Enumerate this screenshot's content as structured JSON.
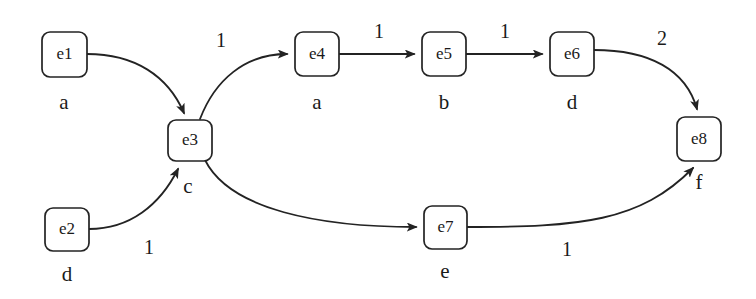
{
  "diagram": {
    "canvas": {
      "width": 756,
      "height": 299,
      "background": "#ffffff"
    },
    "stroke_color": "#232323",
    "text_color": "#1a1a1a",
    "nodes": [
      {
        "id": "e1",
        "label": "e1",
        "state": "a",
        "x": 42,
        "y": 32,
        "w": 45,
        "h": 45,
        "state_x": 64,
        "state_y": 104
      },
      {
        "id": "e2",
        "label": "e2",
        "state": "d",
        "x": 45,
        "y": 208,
        "w": 44,
        "h": 43,
        "state_x": 67,
        "state_y": 276
      },
      {
        "id": "e3",
        "label": "e3",
        "state": "c",
        "x": 168,
        "y": 120,
        "w": 44,
        "h": 41,
        "state_x": 188,
        "state_y": 188
      },
      {
        "id": "e4",
        "label": "e4",
        "state": "a",
        "x": 295,
        "y": 32,
        "w": 44,
        "h": 44,
        "state_x": 317,
        "state_y": 104
      },
      {
        "id": "e5",
        "label": "e5",
        "state": "b",
        "x": 422,
        "y": 32,
        "w": 44,
        "h": 44,
        "state_x": 444,
        "state_y": 104
      },
      {
        "id": "e6",
        "label": "e6",
        "state": "d",
        "x": 550,
        "y": 32,
        "w": 44,
        "h": 44,
        "state_x": 572,
        "state_y": 104
      },
      {
        "id": "e7",
        "label": "e7",
        "state": "e",
        "x": 424,
        "y": 206,
        "w": 43,
        "h": 43,
        "state_x": 445,
        "state_y": 273
      },
      {
        "id": "e8",
        "label": "e8",
        "state": "f",
        "x": 677,
        "y": 117,
        "w": 44,
        "h": 44,
        "state_x": 699,
        "state_y": 184
      }
    ],
    "edges": [
      {
        "id": "e1-e3",
        "from": "e1",
        "to": "e3",
        "weight": "",
        "weight_x": 0,
        "weight_y": 0,
        "path": "M 87 54 C 135 54 168 76 184 113"
      },
      {
        "id": "e2-e3",
        "from": "e2",
        "to": "e3",
        "weight": "1",
        "weight_x": 149,
        "weight_y": 249,
        "path": "M 89 229 C 130 229 160 205 178 169"
      },
      {
        "id": "e3-e4",
        "from": "e3",
        "to": "e4",
        "weight": "1",
        "weight_x": 221,
        "weight_y": 42,
        "path": "M 200 119 C 215 80 245 54 287 54"
      },
      {
        "id": "e4-e5",
        "from": "e4",
        "to": "e5",
        "weight": "1",
        "weight_x": 379,
        "weight_y": 33,
        "path": "M 339 54 L 414 54"
      },
      {
        "id": "e5-e6",
        "from": "e5",
        "to": "e6",
        "weight": "1",
        "weight_x": 505,
        "weight_y": 33,
        "path": "M 466 54 L 542 54"
      },
      {
        "id": "e6-e8",
        "from": "e6",
        "to": "e8",
        "weight": "2",
        "weight_x": 662,
        "weight_y": 40,
        "path": "M 594 50 C 650 50 686 70 697 109"
      },
      {
        "id": "e3-e7",
        "from": "e3",
        "to": "e7",
        "weight": "",
        "weight_x": 0,
        "weight_y": 0,
        "path": "M 205 160 C 230 210 320 227 416 227"
      },
      {
        "id": "e7-e8",
        "from": "e7",
        "to": "e8",
        "weight": "1",
        "weight_x": 567,
        "weight_y": 251,
        "path": "M 467 227 C 580 227 640 222 693 168"
      }
    ]
  }
}
